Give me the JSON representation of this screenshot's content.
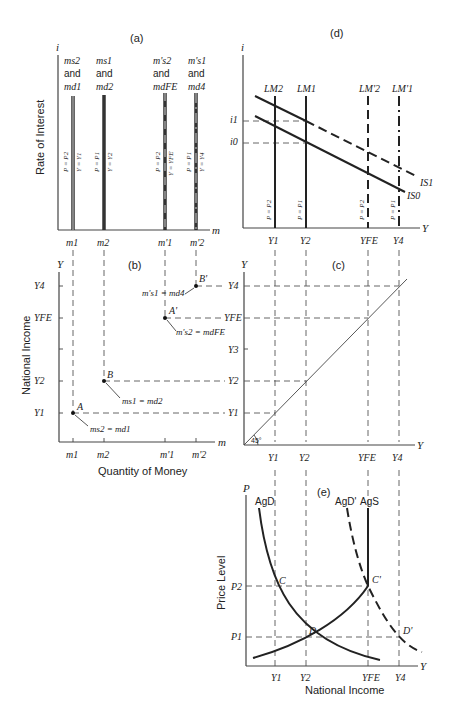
{
  "figure": {
    "panels": {
      "a": {
        "label": "(a)",
        "y_axis": "i",
        "x_axis": "m",
        "y_title": "Rate of Interest",
        "x_ticks": [
          "m1",
          "m2",
          "m'1",
          "m'2"
        ],
        "curves": [
          {
            "top1": "ms2",
            "top2": "and",
            "top3": "md1",
            "left": "P = P2",
            "right": "Y = Y1"
          },
          {
            "top1": "ms1",
            "top2": "and",
            "top3": "md2",
            "left": "P = P1",
            "right": "Y = Y2"
          },
          {
            "top1": "m's2",
            "top2": "and",
            "top3": "mdFE",
            "left": "P = P2",
            "right": "Y = YFE"
          },
          {
            "top1": "m's1",
            "top2": "and",
            "top3": "md4",
            "left": "P = P1",
            "right": "Y = Y4"
          }
        ]
      },
      "b": {
        "label": "(b)",
        "y_axis": "Y",
        "x_axis": "m",
        "y_title": "National Income",
        "x_title": "Quantity of Money",
        "y_ticks": [
          "Y4",
          "YFE",
          "Y2",
          "Y1"
        ],
        "x_ticks": [
          "m1",
          "m2",
          "m'1",
          "m'2"
        ],
        "points": [
          {
            "name": "A",
            "eq": "ms2 = md1"
          },
          {
            "name": "B",
            "eq": "ms1 = md2"
          },
          {
            "name": "A'",
            "eq": "m's2 = mdFE"
          },
          {
            "name": "B'",
            "eq": "m's1 = md4"
          }
        ]
      },
      "c": {
        "label": "(c)",
        "y_axis": "Y",
        "x_axis": "Y",
        "y_ticks": [
          "Y4",
          "YFE",
          "Y3",
          "Y2",
          "Y1"
        ],
        "x_ticks": [
          "Y1",
          "Y2",
          "YFE",
          "Y4"
        ],
        "angle": "45°"
      },
      "d": {
        "label": "(d)",
        "y_axis": "i",
        "x_axis": "Y",
        "y_ticks": [
          "i1",
          "i0"
        ],
        "x_ticks": [
          "Y1",
          "Y2",
          "YFE",
          "Y4"
        ],
        "lm_curves": [
          "LM2",
          "LM1",
          "LM'2",
          "LM'1"
        ],
        "lm_prices": [
          "P = P2",
          "P = P1",
          "P = P2",
          "P = P1"
        ],
        "is_curves": [
          "IS1",
          "IS0"
        ]
      },
      "e": {
        "label": "(e)",
        "y_axis": "P",
        "x_axis": "Y",
        "y_title": "Price Level",
        "x_title": "National Income",
        "y_ticks": [
          "P2",
          "P1"
        ],
        "x_ticks": [
          "Y1",
          "Y2",
          "YFE",
          "Y4"
        ],
        "curves": [
          "AgD",
          "AgD'",
          "AgS"
        ],
        "points": [
          "C",
          "C'",
          "D",
          "D'"
        ]
      }
    }
  }
}
